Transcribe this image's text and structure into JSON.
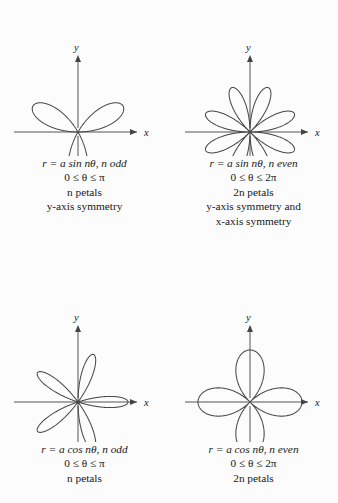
{
  "figure": {
    "kind": "polar-rose-reference-chart",
    "background_color": "#fcfcfc",
    "ink_color": "#3a3a3a",
    "text_color": "#181818"
  },
  "panels": [
    {
      "id": "top-left",
      "axis": {
        "x_label": "x",
        "y_label": "y"
      },
      "caption": {
        "line1_pre": "r = a sin n",
        "line1_theta": "θ",
        "line1_post": ", n odd",
        "line2": "0 ≤ θ ≤ π",
        "line3": "n petals",
        "line4": "y-axis symmetry"
      }
    },
    {
      "id": "top-right",
      "axis": {
        "x_label": "x",
        "y_label": "y"
      },
      "caption": {
        "line1_pre": "r = a sin n",
        "line1_theta": "θ",
        "line1_post": ", n even",
        "line2": "0 ≤ θ ≤ 2π",
        "line3": "2n petals",
        "line4": "y-axis symmetry and",
        "line5": "x-axis symmetry"
      }
    },
    {
      "id": "bottom-left",
      "axis": {
        "x_label": "x",
        "y_label": "y"
      },
      "caption": {
        "line1_pre": "r = a cos n",
        "line1_theta": "θ",
        "line1_post": ", n odd",
        "line2": "0 ≤ θ ≤ π",
        "line3": "n petals"
      }
    },
    {
      "id": "bottom-right",
      "axis": {
        "x_label": "x",
        "y_label": "y"
      },
      "caption": {
        "line1_pre": "r = a cos n",
        "line1_theta": "θ",
        "line1_post": ", n even",
        "line2": "0 ≤ θ ≤ 2π",
        "line3": "2n petals"
      }
    }
  ],
  "chart_data": [
    {
      "type": "line",
      "title": "r = a sin nθ, n odd",
      "subtitle": "0 ≤ θ ≤ π; n petals; y-axis symmetry",
      "polar": true,
      "equation": "r = a*sin(n*theta)",
      "n": 3,
      "amplitude": 52,
      "petals": 3,
      "theta_range_deg": [
        0,
        180
      ],
      "petal_axis_angles_deg": [
        30,
        150,
        270
      ],
      "xlabel": "x",
      "ylabel": "y",
      "grid": false
    },
    {
      "type": "line",
      "title": "r = a sin nθ, n even",
      "subtitle": "0 ≤ θ ≤ 2π; 2n petals; y-axis symmetry and x-axis symmetry",
      "polar": true,
      "equation": "r = a*sin(n*theta)",
      "n": 4,
      "amplitude": 48,
      "petals": 8,
      "theta_range_deg": [
        0,
        360
      ],
      "petal_axis_angles_deg": [
        22.5,
        67.5,
        112.5,
        157.5,
        202.5,
        247.5,
        292.5,
        337.5
      ],
      "xlabel": "x",
      "ylabel": "y",
      "grid": false
    },
    {
      "type": "line",
      "title": "r = a cos nθ, n odd",
      "subtitle": "0 ≤ θ ≤ π; n petals",
      "polar": true,
      "equation": "r = a*cos(n*theta)",
      "n": 5,
      "amplitude": 50,
      "petals": 5,
      "theta_range_deg": [
        0,
        180
      ],
      "petal_axis_angles_deg": [
        0,
        72,
        144,
        216,
        288
      ],
      "xlabel": "x",
      "ylabel": "y",
      "grid": false
    },
    {
      "type": "line",
      "title": "r = a cos nθ, n even",
      "subtitle": "0 ≤ θ ≤ 2π; 2n petals",
      "polar": true,
      "equation": "r = a*cos(n*theta)",
      "n": 2,
      "amplitude": 52,
      "petals": 4,
      "theta_range_deg": [
        0,
        360
      ],
      "petal_axis_angles_deg": [
        0,
        90,
        180,
        270
      ],
      "xlabel": "x",
      "ylabel": "y",
      "grid": false
    }
  ]
}
